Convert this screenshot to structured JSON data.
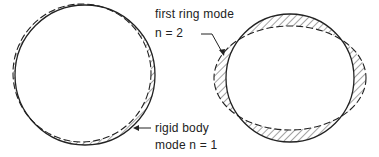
{
  "diagram": {
    "left": {
      "label_line1": "rigid body",
      "label_line2": "mode n = 1",
      "mode_n": 1
    },
    "right": {
      "label_line1": "first ring mode",
      "label_line2": "n = 2",
      "mode_n": 2
    },
    "colors": {
      "stroke": "#222222",
      "background": "#ffffff"
    }
  }
}
